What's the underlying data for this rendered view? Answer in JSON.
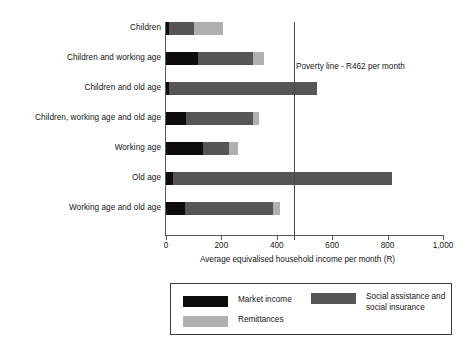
{
  "chart_data": {
    "type": "bar",
    "orientation": "horizontal",
    "stacked": true,
    "title": "",
    "xlabel": "Average equivalised household income per month (R)",
    "ylabel": "",
    "xlim": [
      0,
      1000
    ],
    "grid": false,
    "legend_position": "bottom",
    "x_ticks": [
      {
        "value": 0,
        "label": "0"
      },
      {
        "value": 200,
        "label": "200"
      },
      {
        "value": 400,
        "label": "400"
      },
      {
        "value": 600,
        "label": "600"
      },
      {
        "value": 800,
        "label": "800"
      },
      {
        "value": 1000,
        "label": "1,000"
      }
    ],
    "categories": [
      "Children",
      "Children and working age",
      "Children and old age",
      "Children, working age and old age",
      "Working age",
      "Old age",
      "Working age and old age"
    ],
    "series": [
      {
        "name": "Market income",
        "color": "#0d0d0d",
        "values": [
          11,
          115,
          10,
          72,
          133,
          25,
          68
        ]
      },
      {
        "name": "Social assistance and social insurance",
        "color": "#555555",
        "values": [
          89,
          200,
          535,
          242,
          94,
          790,
          319
        ]
      },
      {
        "name": "Remittances",
        "color": "#b0b0b0",
        "values": [
          105,
          40,
          0,
          22,
          32,
          0,
          25
        ]
      }
    ],
    "totals": [
      205,
      355,
      545,
      336,
      259,
      815,
      412
    ],
    "annotations": [
      {
        "name": "poverty-line",
        "value": 462,
        "label": "Poverty line - R462 per month"
      }
    ]
  },
  "legend": {
    "items": [
      {
        "label": "Market income",
        "color": "#0d0d0d"
      },
      {
        "label": "Social assistance and\nsocial insurance",
        "color": "#555555"
      },
      {
        "label": "Remittances",
        "color": "#b0b0b0"
      }
    ]
  }
}
